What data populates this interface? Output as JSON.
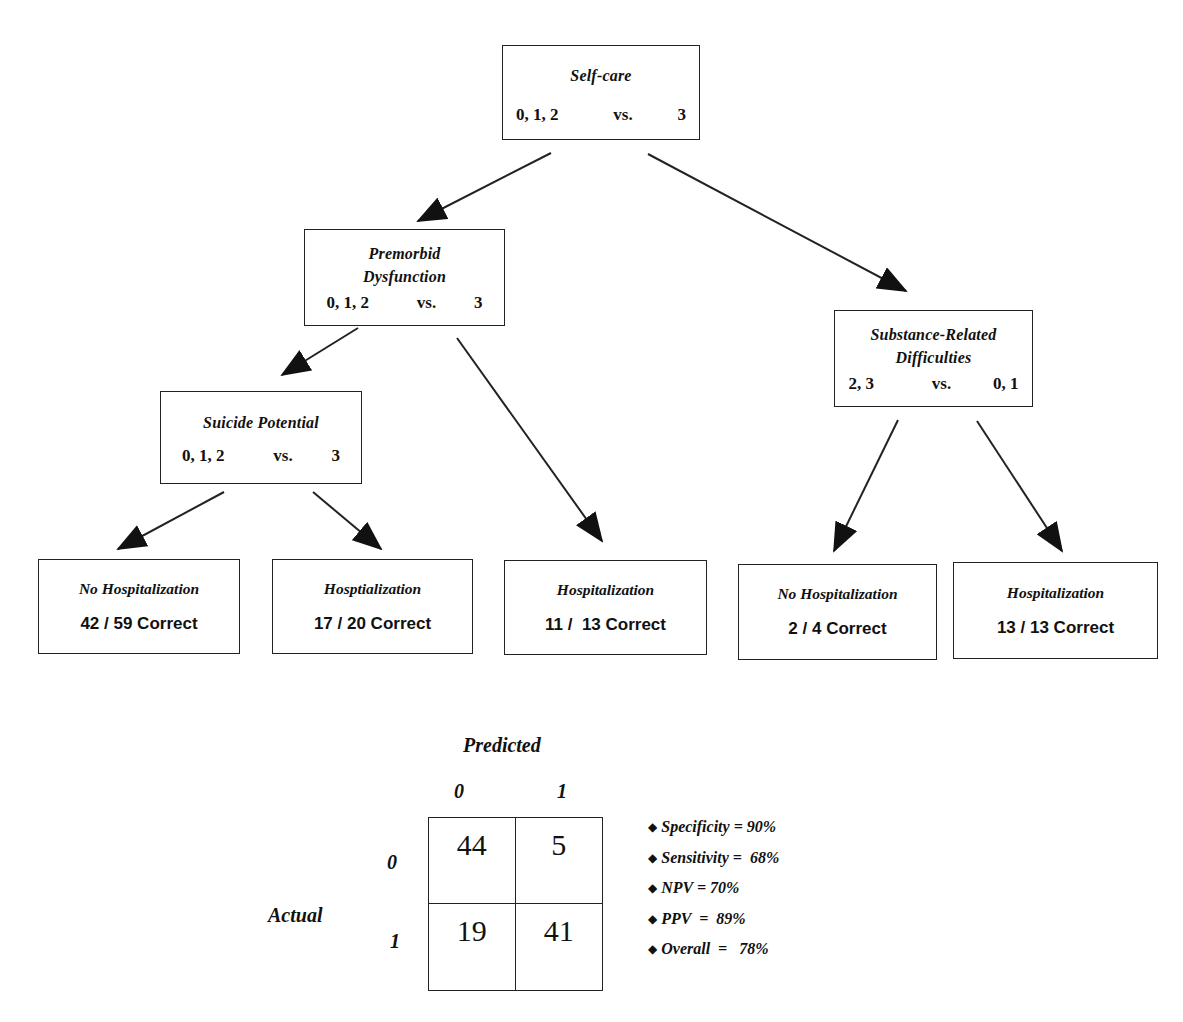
{
  "tree": {
    "root": {
      "title": "Self-care",
      "left_split": "0, 1, 2",
      "vs": "vs.",
      "right_split": "3"
    },
    "premorbid": {
      "title_line1": "Premorbid",
      "title_line2": "Dysfunction",
      "left_split": "0, 1, 2",
      "vs": "vs.",
      "right_split": "3"
    },
    "substance": {
      "title_line1": "Substance-Related",
      "title_line2": "Difficulties",
      "left_split": "2, 3",
      "vs": "vs.",
      "right_split": "0, 1"
    },
    "suicide": {
      "title": "Suicide Potential",
      "left_split": "0, 1, 2",
      "vs": "vs.",
      "right_split": "3"
    },
    "leaves": [
      {
        "title": "No Hospitalization",
        "count": "42 / 59 Correct"
      },
      {
        "title": "Hosptialization",
        "count": "17 / 20 Correct"
      },
      {
        "title": "Hospitalization",
        "count": "11 /  13 Correct"
      },
      {
        "title": "No Hospitalization",
        "count": "2 / 4 Correct"
      },
      {
        "title": "Hospitalization",
        "count": "13 / 13 Correct"
      }
    ]
  },
  "confusion_matrix": {
    "predicted_label": "Predicted",
    "actual_label": "Actual",
    "col_headers": [
      "0",
      "1"
    ],
    "row_headers": [
      "0",
      "1"
    ],
    "cells": [
      [
        "44",
        "5"
      ],
      [
        "19",
        "41"
      ]
    ]
  },
  "metrics": [
    {
      "bullet": "◆",
      "text": "Specificity = 90%"
    },
    {
      "bullet": "◆",
      "text": "Sensitivity =  68%"
    },
    {
      "bullet": "◆",
      "text": "NPV = 70%"
    },
    {
      "bullet": "◆",
      "text": "PPV  =  89%"
    },
    {
      "bullet": "◆",
      "text": "Overall  =   78%"
    }
  ],
  "colors": {
    "line": "#222222",
    "background": "#ffffff"
  }
}
